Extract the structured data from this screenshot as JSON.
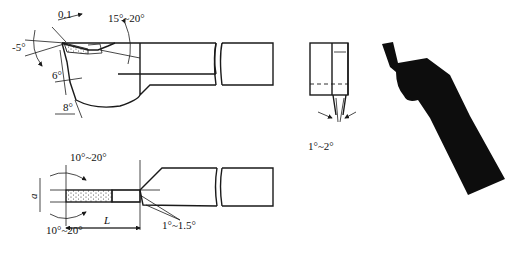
{
  "figure": {
    "views": {
      "side_view": {
        "labels": {
          "chip_land": "0.1",
          "rake_angle": "-5°",
          "clearance_top": "6°",
          "clearance_bottom": "8°",
          "secondary_rake": "15°~20°"
        }
      },
      "top_view": {
        "labels": {
          "angle_top": "10°~20°",
          "angle_bottom": "10°~20°",
          "width": "a",
          "length": "L",
          "side_clearance": "1°~1.5°"
        }
      },
      "end_view": {
        "labels": {
          "side_taper": "1°~2°"
        }
      },
      "photo_view": {
        "description": "silhouette of cutting tool"
      }
    }
  }
}
